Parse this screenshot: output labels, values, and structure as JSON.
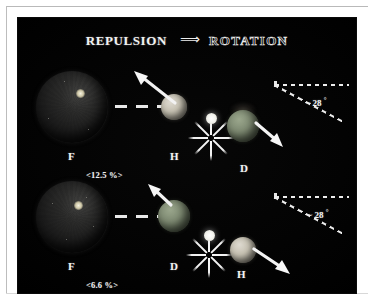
{
  "figure": {
    "title": {
      "left_word": "REPULSION",
      "arrow": "⟹",
      "right_word": "ROTATION"
    },
    "background_color": "#000000",
    "page_color": "#ffffff",
    "accent_color": "#ededed",
    "rows": [
      {
        "id": "row-upper",
        "percent_label": "<12.5 %>",
        "planet_label": "F",
        "near_sphere_label": "H",
        "far_sphere_label": "D",
        "near_sphere_color": "#c6c1b2",
        "far_sphere_color": "#7e8a72",
        "angle_label_tilde": "~",
        "angle_label_value": "28",
        "angle_label_unit": "°",
        "angle_degrees": 28
      },
      {
        "id": "row-lower",
        "percent_label": "<6.6 %>",
        "planet_label": "F",
        "near_sphere_label": "D",
        "far_sphere_label": "H",
        "near_sphere_color": "#7e8a72",
        "far_sphere_color": "#c6c1b2",
        "angle_label_tilde": "~",
        "angle_label_value": "28",
        "angle_label_unit": "°",
        "angle_degrees": 28
      }
    ]
  }
}
